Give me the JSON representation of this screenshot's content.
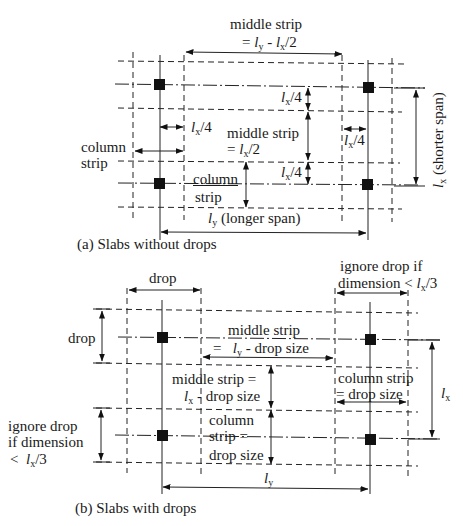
{
  "diagram": {
    "panel_a": {
      "caption": "(a) Slabs without drops",
      "labels": {
        "top_middle_strip_title": "middle strip",
        "top_middle_strip_formula_prefix": "= ",
        "top_middle_strip_formula": "l",
        "top_middle_strip_sub_y": "y",
        "top_middle_strip_minus": " - ",
        "top_middle_strip_l2": "l",
        "top_middle_strip_sub_x": "x",
        "top_middle_strip_tail": "/2",
        "lx4_l": "l",
        "lx4_sub": "x",
        "lx4_tail": "/4",
        "column_strip_left_1": "column",
        "column_strip_left_2": "strip",
        "middle_strip_center_1": "middle strip",
        "middle_strip_center_2_prefix": "= ",
        "middle_strip_center_2_tail": "/2",
        "column_strip_center_1": "column",
        "column_strip_center_2": "strip",
        "longer_span_tail": " (longer span)",
        "shorter_span_tail": " (shorter span)"
      }
    },
    "panel_b": {
      "caption": "(b) Slabs with drops",
      "labels": {
        "drop_top": "drop",
        "drop_left": "drop",
        "ignore_top_1": "ignore drop if",
        "ignore_top_2": "dimension <",
        "ignore_tail": "/3",
        "middle_strip_top_1": "middle strip",
        "middle_strip_top_2_prefix": "=",
        "middle_strip_top_2_tail": " - drop size",
        "middle_strip_mid_1": "middle strip =",
        "middle_strip_mid_2_tail": " - drop size",
        "column_strip_right_1": "column strip",
        "column_strip_right_2": "= drop size",
        "column_strip_center_1": "column",
        "column_strip_center_2": "strip =",
        "column_strip_center_3": "drop size",
        "ignore_left_1": "ignore drop",
        "ignore_left_2": "if dimension",
        "ignore_left_3_prefix": "<",
        "l": "l",
        "sub_x": "x",
        "sub_y": "y"
      }
    }
  }
}
